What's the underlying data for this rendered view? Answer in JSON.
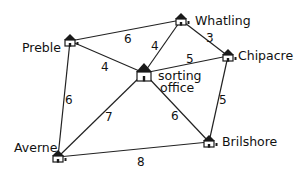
{
  "diagram": {
    "type": "weighted-graph",
    "nodes": [
      {
        "id": "preble",
        "label": "Preble",
        "x": 70,
        "y": 41,
        "lx": 22,
        "ly": 52
      },
      {
        "id": "whatling",
        "label": "Whatling",
        "x": 181,
        "y": 20,
        "lx": 195,
        "ly": 25
      },
      {
        "id": "chipacre",
        "label": "Chipacre",
        "x": 228,
        "y": 56,
        "lx": 238,
        "ly": 60
      },
      {
        "id": "sorting",
        "label": "sorting",
        "label2": "office",
        "x": 144,
        "y": 73,
        "lx": 158,
        "ly": 80,
        "lx2": 160,
        "ly2": 92
      },
      {
        "id": "averne",
        "label": "Averne",
        "x": 58,
        "y": 157,
        "lx": 14,
        "ly": 152
      },
      {
        "id": "brilshore",
        "label": "Brilshore",
        "x": 209,
        "y": 142,
        "lx": 222,
        "ly": 146
      }
    ],
    "edges": [
      {
        "from": "preble",
        "to": "whatling",
        "weight": "6",
        "wx": 124,
        "wy": 43
      },
      {
        "from": "preble",
        "to": "sorting",
        "weight": "4",
        "wx": 101,
        "wy": 71
      },
      {
        "from": "whatling",
        "to": "sorting",
        "weight": "4",
        "wx": 151,
        "wy": 50
      },
      {
        "from": "whatling",
        "to": "chipacre",
        "weight": "3",
        "wx": 206,
        "wy": 42
      },
      {
        "from": "sorting",
        "to": "chipacre",
        "weight": "5",
        "wx": 186,
        "wy": 63
      },
      {
        "from": "preble",
        "to": "averne",
        "weight": "6",
        "wx": 65,
        "wy": 104
      },
      {
        "from": "sorting",
        "to": "averne",
        "weight": "7",
        "wx": 105,
        "wy": 121
      },
      {
        "from": "sorting",
        "to": "brilshore",
        "weight": "6",
        "wx": 171,
        "wy": 120
      },
      {
        "from": "chipacre",
        "to": "brilshore",
        "weight": "5",
        "wx": 219,
        "wy": 104
      },
      {
        "from": "averne",
        "to": "brilshore",
        "weight": "8",
        "wx": 137,
        "wy": 166
      }
    ]
  }
}
